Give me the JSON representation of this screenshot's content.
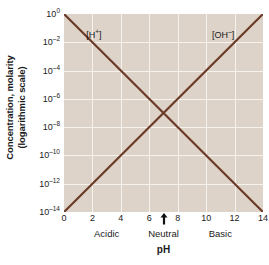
{
  "chart_data": {
    "type": "line",
    "title": "",
    "xlabel": "pH",
    "ylabel_line1": "Concentration, molarity",
    "ylabel_line2": "(logarithmic scale)",
    "xlim": [
      0,
      14
    ],
    "ylim_exponent": [
      -14,
      0
    ],
    "grid": true,
    "legend_position": "inline-annotation",
    "xticks": [
      {
        "value": 0,
        "label": "0"
      },
      {
        "value": 2,
        "label": "2"
      },
      {
        "value": 4,
        "label": "4"
      },
      {
        "value": 6,
        "label": "6"
      },
      {
        "value": 8,
        "label": "8"
      },
      {
        "value": 10,
        "label": "10"
      },
      {
        "value": 12,
        "label": "12"
      },
      {
        "value": 14,
        "label": "14"
      }
    ],
    "yticks": [
      {
        "exponent": 0,
        "mantissa": "10",
        "sup": "0"
      },
      {
        "exponent": -2,
        "mantissa": "10",
        "sup": "–2"
      },
      {
        "exponent": -4,
        "mantissa": "10",
        "sup": "–4"
      },
      {
        "exponent": -6,
        "mantissa": "10",
        "sup": "–6"
      },
      {
        "exponent": -8,
        "mantissa": "10",
        "sup": "–8"
      },
      {
        "exponent": -10,
        "mantissa": "10",
        "sup": "–10"
      },
      {
        "exponent": -12,
        "mantissa": "10",
        "sup": "–12"
      },
      {
        "exponent": -14,
        "mantissa": "10",
        "sup": "–14"
      }
    ],
    "series": [
      {
        "name": "[H+]",
        "label_text": "[H",
        "label_sup": "+",
        "label_tail": "]",
        "color": "#6b3b28",
        "label_x": 2.1,
        "label_exponent": -1.5,
        "x": [
          0,
          14
        ],
        "y_exponent": [
          0,
          -14
        ]
      },
      {
        "name": "[OH-]",
        "label_text": "[OH",
        "label_sup": "–",
        "label_tail": "]",
        "color": "#6b3b28",
        "label_x": 11.2,
        "label_exponent": -1.5,
        "x": [
          0,
          14
        ],
        "y_exponent": [
          -14,
          0
        ]
      }
    ],
    "annotations": [
      {
        "name": "acidic-region",
        "label": "Acidic",
        "x": 3
      },
      {
        "name": "neutral-region",
        "label": "Neutral",
        "x": 7
      },
      {
        "name": "basic-region",
        "label": "Basic",
        "x": 11
      }
    ],
    "neutral_marker": {
      "name": "neutral-arrow",
      "x": 7,
      "glyph": "up-arrow"
    },
    "colors": {
      "plot_background": "#ded3c9",
      "gridline": "#f6f2ee",
      "line": "#6b3b28",
      "page_background": "#ffffff",
      "text": "#1a1a1a"
    }
  }
}
